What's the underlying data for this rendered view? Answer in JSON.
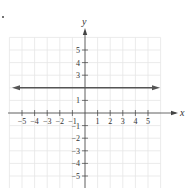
{
  "chart_data": {
    "type": "line",
    "title": "",
    "xlabel": "x",
    "ylabel": "y",
    "xlim": [
      -6,
      6
    ],
    "ylim": [
      -6,
      6
    ],
    "grid": true,
    "x_ticks": [
      -5,
      -4,
      -3,
      -2,
      -1,
      1,
      2,
      3,
      4,
      5
    ],
    "y_ticks": [
      -5,
      -4,
      -3,
      -2,
      -1,
      1,
      3,
      4,
      5
    ],
    "x_tick_labels": [
      "−5",
      "−4",
      "−3",
      "−2",
      "−1",
      "1",
      "2",
      "3",
      "4",
      "5"
    ],
    "y_tick_labels": [
      "−5",
      "−4",
      "−3",
      "−2",
      "−1",
      "1",
      "3",
      "4",
      "5"
    ],
    "series": [
      {
        "name": "y = 2",
        "kind": "horizontal-line",
        "x": [
          -6,
          6
        ],
        "y": [
          2,
          2
        ],
        "arrows": "both"
      }
    ]
  },
  "colors": {
    "axis": "#444444",
    "grid": "#e6e6e6",
    "line": "#555555",
    "text": "#333333"
  }
}
